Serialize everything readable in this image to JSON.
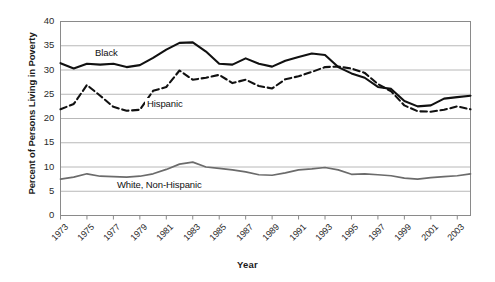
{
  "chart_data": {
    "type": "line",
    "title": "",
    "xlabel": "Year",
    "ylabel": "Percent of Persons Living in Poverty",
    "xlim": [
      1973,
      2004
    ],
    "ylim": [
      0,
      40
    ],
    "ytick_values": [
      0,
      5,
      10,
      15,
      20,
      25,
      30,
      35,
      40
    ],
    "xtick_values": [
      1973,
      1975,
      1977,
      1979,
      1981,
      1983,
      1985,
      1987,
      1989,
      1991,
      1993,
      1995,
      1997,
      1999,
      2001,
      2003
    ],
    "xtick_labels": [
      "1973",
      "1975",
      "1977",
      "1979",
      "1981",
      "1983",
      "1985",
      "1987",
      "1989",
      "1991",
      "1993",
      "1995",
      "1997",
      "1999",
      "2001",
      "2003"
    ],
    "grid": "horizontal",
    "legend_position": "inline-labels",
    "x": [
      1973,
      1974,
      1975,
      1976,
      1977,
      1978,
      1979,
      1980,
      1981,
      1982,
      1983,
      1984,
      1985,
      1986,
      1987,
      1988,
      1989,
      1990,
      1991,
      1992,
      1993,
      1994,
      1995,
      1996,
      1997,
      1998,
      1999,
      2000,
      2001,
      2002,
      2003,
      2004
    ],
    "series": [
      {
        "name": "Black",
        "style": "solid",
        "color": "#111111",
        "values": [
          31.4,
          30.3,
          31.3,
          31.1,
          31.3,
          30.6,
          31.0,
          32.5,
          34.2,
          35.6,
          35.7,
          33.8,
          31.3,
          31.1,
          32.4,
          31.3,
          30.7,
          31.9,
          32.7,
          33.4,
          33.1,
          30.6,
          29.3,
          28.4,
          26.5,
          26.1,
          23.6,
          22.5,
          22.7,
          24.1,
          24.4,
          24.7
        ]
      },
      {
        "name": "Hispanic",
        "style": "dashed",
        "color": "#111111",
        "values": [
          21.9,
          23.0,
          26.9,
          24.7,
          22.4,
          21.6,
          21.8,
          25.7,
          26.5,
          29.9,
          28.0,
          28.4,
          29.0,
          27.3,
          28.0,
          26.7,
          26.2,
          28.1,
          28.7,
          29.6,
          30.6,
          30.7,
          30.3,
          29.4,
          27.1,
          25.6,
          22.7,
          21.5,
          21.4,
          21.8,
          22.5,
          21.9
        ]
      },
      {
        "name": "White, Non-Hispanic",
        "style": "solid",
        "color": "#6b6b6b",
        "values": [
          7.5,
          7.9,
          8.6,
          8.1,
          8.0,
          7.9,
          8.1,
          8.6,
          9.5,
          10.6,
          11.0,
          10.0,
          9.7,
          9.4,
          9.0,
          8.4,
          8.3,
          8.8,
          9.4,
          9.6,
          9.9,
          9.4,
          8.5,
          8.6,
          8.4,
          8.2,
          7.7,
          7.5,
          7.8,
          8.0,
          8.2,
          8.6
        ]
      }
    ],
    "annotations": [
      {
        "text": "Black",
        "series": "Black"
      },
      {
        "text": "Hispanic",
        "series": "Hispanic"
      },
      {
        "text": "White, Non-Hispanic",
        "series": "White, Non-Hispanic"
      }
    ],
    "colors": {
      "gridline": "#b8b8b8",
      "frame": "#8a8a8a",
      "black_series": "#111111",
      "hispanic_series": "#111111",
      "white_series": "#6b6b6b",
      "background": "#ffffff"
    }
  }
}
